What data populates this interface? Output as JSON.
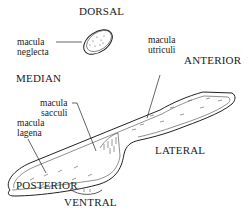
{
  "diagram": {
    "directions": {
      "dorsal": "DORSAL",
      "median": "MEDIAN",
      "anterior": "ANTERIOR",
      "lateral": "LATERAL",
      "posterior": "POSTERIOR",
      "ventral": "VENTRAL"
    },
    "maculae": {
      "neglecta": {
        "line1": "macula",
        "line2": "neglecta"
      },
      "utriculi": {
        "line1": "macula",
        "line2": "utriculi"
      },
      "sacculi": {
        "line1": "macula",
        "line2": "sacculi"
      },
      "lagena": {
        "line1": "macula",
        "line2": "lagena"
      }
    },
    "colors": {
      "ink": "#222222",
      "background": "#ffffff"
    }
  }
}
